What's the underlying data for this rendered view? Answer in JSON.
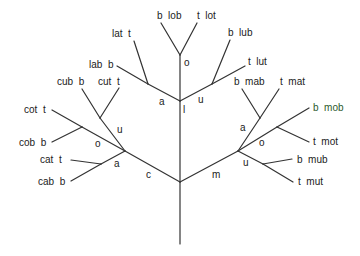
{
  "diagram": {
    "type": "tree",
    "colors": {
      "line": "#333333",
      "text": "#222222",
      "background": "#ffffff"
    },
    "edge_labels": {
      "c": "c",
      "m": "m",
      "l": "l",
      "c_o": "o",
      "c_u": "u",
      "c_a": "a",
      "l_a": "a",
      "l_u": "u",
      "l_o": "o",
      "m_a": "a",
      "m_o": "o",
      "m_u": "u"
    },
    "leaves": {
      "cot": "cot  t",
      "cob": "cob  b",
      "cat": "cat  t",
      "cab": "cab  b",
      "cub": "cub  b",
      "cut": "cut  t",
      "lat": "lat  t",
      "lab": "lab  b",
      "lob": "b  lob",
      "lot": "t  lot",
      "lub": "b  lub",
      "lut": "t  lut",
      "mab": "b  mab",
      "mat": "t  mat",
      "mob": "b  mob",
      "mot": "t  mot",
      "mub": "b  mub",
      "mut": "t  mut"
    }
  }
}
